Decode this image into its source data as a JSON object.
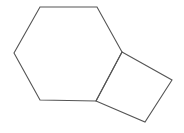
{
  "figure": {
    "kind": "skeletal-line-drawing",
    "width": 184,
    "height": 133,
    "background_color": "#ffffff",
    "stroke_color": "#555555",
    "stroke_width": 1.1,
    "fill_color": "none",
    "shapes": [
      {
        "id": "hexagon",
        "name": "six-membered-ring",
        "sides": 6,
        "points": "40,7 97,7 122,52 96,101 40,100 14,53",
        "vertices": [
          {
            "label": "top-left",
            "x": 40,
            "y": 7
          },
          {
            "label": "top-right",
            "x": 97,
            "y": 7
          },
          {
            "label": "right-upper-fusion",
            "x": 122,
            "y": 52
          },
          {
            "label": "right-lower-fusion",
            "x": 96,
            "y": 101
          },
          {
            "label": "bottom-left",
            "x": 40,
            "y": 100
          },
          {
            "label": "left",
            "x": 14,
            "y": 53
          }
        ]
      },
      {
        "id": "square",
        "name": "four-membered-ring",
        "sides": 4,
        "points": "122,52 172,80 145,122 96,101",
        "vertices": [
          {
            "label": "top-fusion",
            "x": 122,
            "y": 52
          },
          {
            "label": "right",
            "x": 172,
            "y": 80
          },
          {
            "label": "bottom",
            "x": 145,
            "y": 122
          },
          {
            "label": "left-fusion",
            "x": 96,
            "y": 101
          }
        ]
      }
    ],
    "fusion_bond": {
      "name": "shared-edge",
      "from_x": 122,
      "from_y": 52,
      "to_x": 96,
      "to_y": 101
    }
  }
}
